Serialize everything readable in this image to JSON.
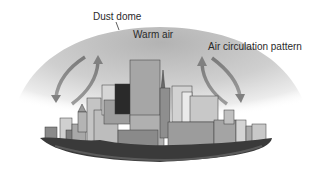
{
  "diagram": {
    "labels": {
      "dust_dome": "Dust dome",
      "warm_air": "Warm air",
      "air_circulation": "Air circulation pattern"
    },
    "elements": {
      "dome": "dust-dome",
      "city": "city-skyline",
      "arrows": [
        "left-circulation-arrows",
        "right-circulation-arrows"
      ]
    },
    "colors": {
      "dome_top": "#b8b8b8",
      "dome_edge": "#f4f4f4",
      "arrow": "#8c8c8c",
      "buildings": "#9a9a9a",
      "trees": "#3a3a3a"
    }
  }
}
